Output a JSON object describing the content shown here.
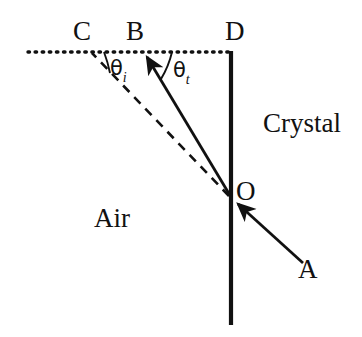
{
  "figure": {
    "background_color": "#ffffff",
    "ink_color": "#111111"
  },
  "labels": {
    "point_c": "C",
    "point_b": "B",
    "point_d": "D",
    "point_o": "O",
    "point_a": "A",
    "region_crystal": "Crystal",
    "region_air": "Air",
    "angle_incidence_symbol": "θ",
    "angle_incidence_subscript": "i",
    "angle_transmission_symbol": "θ",
    "angle_transmission_subscript": "t"
  },
  "geometry": {
    "interface_line": {
      "x": 231,
      "y_top": 52,
      "y_bottom": 325,
      "style": "solid",
      "width_px": 4
    },
    "surface_normal_dotted_line": {
      "x_start": 28,
      "x_end": 231,
      "y": 52,
      "style": "dotted",
      "width_px": 3
    },
    "incident_ray": {
      "from": [
        302,
        262
      ],
      "to": [
        234,
        200
      ],
      "style": "solid",
      "arrow": "at-end"
    },
    "refracted_ray": {
      "from": [
        231,
        197
      ],
      "to": [
        143,
        52
      ],
      "style": "solid",
      "arrow": "at-end"
    },
    "extension_dashed_ray": {
      "from": [
        231,
        197
      ],
      "to": [
        92,
        52
      ],
      "style": "dashed"
    },
    "point_o_position": [
      231,
      197
    ],
    "angle_arc_incidence": {
      "center": [
        231,
        197
      ],
      "between": [
        "dotted-line",
        "dashed-ray"
      ]
    },
    "angle_arc_transmission": {
      "center": [
        231,
        197
      ],
      "between": [
        "dotted-line",
        "refracted-ray"
      ]
    }
  }
}
